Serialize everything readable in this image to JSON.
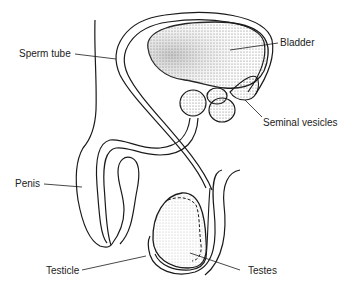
{
  "diagram": {
    "type": "anatomical-illustration",
    "colors": {
      "line": "#1a1a1a",
      "background": "#ffffff",
      "stipple": "#555555"
    },
    "labels": [
      {
        "id": "sperm_tube",
        "text": "Sperm tube"
      },
      {
        "id": "bladder",
        "text": "Bladder"
      },
      {
        "id": "seminal_vesicles",
        "text": "Seminal vesicles"
      },
      {
        "id": "penis",
        "text": "Penis"
      },
      {
        "id": "testicle",
        "text": "Testicle"
      },
      {
        "id": "testes",
        "text": "Testes"
      }
    ]
  }
}
